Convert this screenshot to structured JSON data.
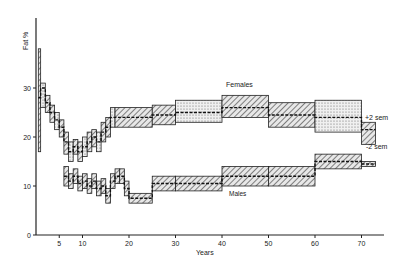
{
  "chart_data": {
    "type": "line",
    "title": "",
    "xlabel": "Years",
    "ylabel": "Fat %",
    "xlim": [
      0,
      75
    ],
    "ylim": [
      0,
      40
    ],
    "x_ticks": [
      5,
      10,
      20,
      30,
      40,
      50,
      60,
      70
    ],
    "y_ticks": [
      0,
      10,
      20,
      30
    ],
    "grid": false,
    "annotations": [
      "Females",
      "Males",
      "+2 sem",
      "-2 sem"
    ],
    "series": [
      {
        "name": "Females",
        "style": "step with ±2 sem band",
        "x": [
          0.5,
          1,
          2,
          3,
          4,
          5,
          6,
          7,
          8,
          9,
          10,
          11,
          12,
          13,
          14,
          15,
          16,
          17,
          25,
          30,
          40,
          50,
          60,
          70
        ],
        "values": [
          28,
          30,
          27,
          25,
          23.5,
          22,
          19,
          17,
          18,
          17,
          18,
          19,
          20,
          19,
          21,
          22,
          24,
          24,
          24.5,
          25,
          26,
          24.5,
          24,
          21.5
        ],
        "upper_2sem": [
          38,
          31,
          28.5,
          26.5,
          25,
          23.5,
          21,
          19,
          19.5,
          19,
          20,
          21,
          21.5,
          21,
          23,
          24,
          26,
          26,
          26.5,
          27.5,
          28.5,
          27,
          27.5,
          23
        ],
        "lower_2sem": [
          17,
          26,
          25,
          23,
          21.5,
          20,
          16.5,
          15,
          16.5,
          15,
          16,
          17,
          18,
          17,
          19,
          20,
          22,
          22,
          22.5,
          23,
          24,
          22,
          21,
          18.5
        ]
      },
      {
        "name": "Males",
        "style": "step with ±2 sem band",
        "x": [
          6,
          7,
          8,
          9,
          10,
          11,
          12,
          13,
          14,
          15,
          16,
          17,
          18,
          19,
          20,
          25,
          30,
          40,
          50,
          60,
          70
        ],
        "values": [
          12,
          11,
          12,
          10.5,
          11,
          10,
          11,
          9.5,
          10,
          8,
          11,
          12,
          12,
          9.5,
          7.5,
          10.5,
          10.5,
          12,
          12,
          15,
          14.5
        ],
        "upper_2sem": [
          14,
          12.5,
          13.5,
          12,
          12.5,
          11.5,
          12.5,
          11,
          11.5,
          9.5,
          12.5,
          13.5,
          13.5,
          11,
          8.5,
          12,
          12,
          14,
          14,
          16.5,
          15
        ],
        "lower_2sem": [
          10,
          9.5,
          10.5,
          9,
          9.5,
          8.5,
          9.5,
          8,
          8.5,
          6.5,
          9.5,
          10.5,
          10.5,
          8,
          6.5,
          9,
          9,
          10,
          10,
          13.5,
          14
        ]
      }
    ]
  },
  "labels": {
    "y_axis": "Fat %",
    "x_axis": "Years",
    "females": "Females",
    "males": "Males",
    "plus_sem": "+2 sem",
    "minus_sem": "-2 sem"
  },
  "ticks": {
    "x": [
      "5",
      "10",
      "20",
      "30",
      "40",
      "50",
      "60",
      "70"
    ],
    "y": [
      "0",
      "10",
      "20",
      "30"
    ]
  }
}
